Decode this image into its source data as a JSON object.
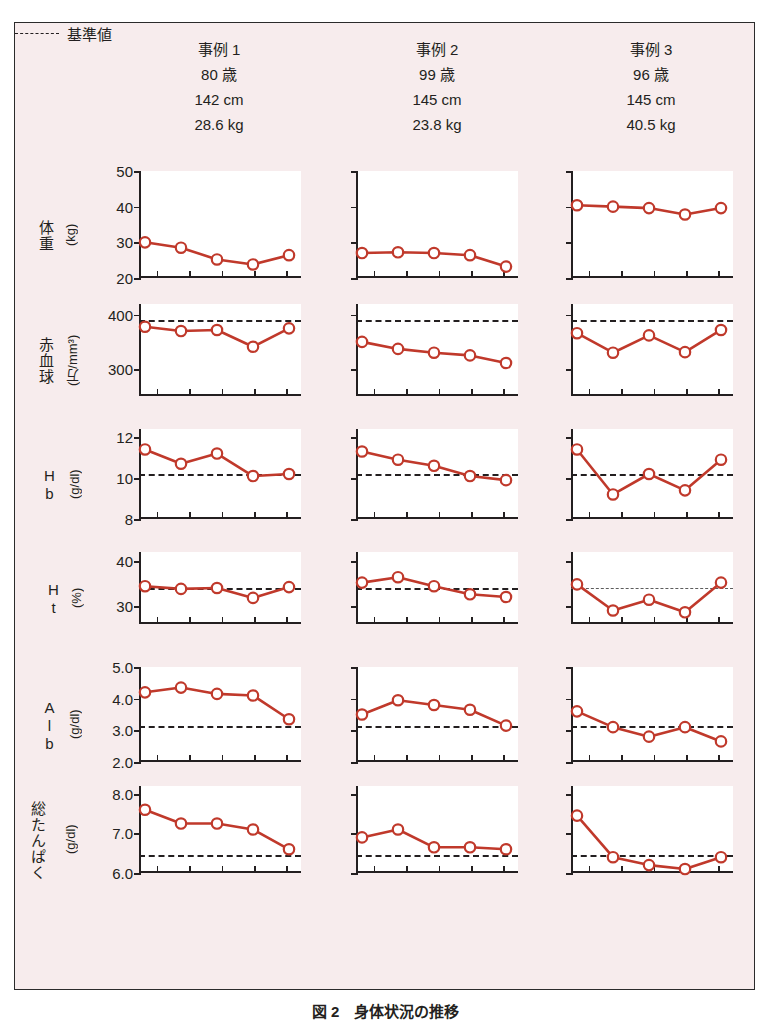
{
  "figure": {
    "caption": "図 2　身体状況の推移",
    "xtitle": "調査回",
    "legend_label": "基準値",
    "x_categories": [
      "第1回",
      "第2回",
      "第3回",
      "第4回",
      "第5回"
    ],
    "x_cat_parts": [
      {
        "top": "第",
        "mid": "1",
        "bot": "回"
      },
      {
        "top": "第",
        "mid": "2",
        "bot": "回"
      },
      {
        "top": "第",
        "mid": "3",
        "bot": "回"
      },
      {
        "top": "第",
        "mid": "4",
        "bot": "回"
      },
      {
        "top": "第",
        "mid": "5",
        "bot": "回"
      }
    ],
    "line_color": "#c0392b",
    "marker_fill": "#ffffff",
    "panel_bg": "#ffffff",
    "figure_bg": "#f7eced"
  },
  "cases": [
    {
      "title": "事例 1",
      "age": "80 歳",
      "height": "142 cm",
      "weight": "28.6 kg"
    },
    {
      "title": "事例 2",
      "age": "99 歳",
      "height": "145 cm",
      "weight": "23.8 kg"
    },
    {
      "title": "事例 3",
      "age": "96 歳",
      "height": "145 cm",
      "weight": "40.5 kg"
    }
  ],
  "rows": [
    {
      "label": "体重",
      "unit": "(kg)"
    },
    {
      "label": "赤血球",
      "unit": "(万/mm³)"
    },
    {
      "label": "Hb",
      "unit": "(g/dl)"
    },
    {
      "label": "Ht",
      "unit": "(%)"
    },
    {
      "label": "Alb",
      "unit": "(g/dl)"
    },
    {
      "label": "総たんぱく",
      "unit": "(g/dl)"
    }
  ],
  "chart_data": {
    "type": "line",
    "title": "図 2　身体状況の推移",
    "xlabel": "調査回",
    "categories": [
      "第1回",
      "第2回",
      "第3回",
      "第4回",
      "第5回"
    ],
    "grid": false,
    "legend": {
      "position": "bottom-right",
      "entries": [
        "基準値"
      ]
    },
    "panels": [
      {
        "row": "体重",
        "ylabel": "体重 (kg)",
        "ylim": [
          20,
          50
        ],
        "yticks": [
          20,
          30,
          40,
          50
        ],
        "reference": null,
        "series": [
          {
            "name": "事例 1",
            "values": [
              30.0,
              28.5,
              25.2,
              23.8,
              26.4
            ]
          },
          {
            "name": "事例 2",
            "values": [
              27.0,
              27.2,
              27.0,
              26.4,
              23.2
            ]
          },
          {
            "name": "事例 3",
            "values": [
              40.4,
              40.0,
              39.6,
              37.8,
              39.6
            ]
          }
        ]
      },
      {
        "row": "赤血球",
        "ylabel": "赤血球 (万/mm³)",
        "ylim": [
          250,
          420
        ],
        "yticks": [
          300,
          400
        ],
        "reference": 390,
        "series": [
          {
            "name": "事例 1",
            "values": [
              378,
              370,
              372,
              341,
              375
            ]
          },
          {
            "name": "事例 2",
            "values": [
              350,
              337,
              330,
              325,
              311
            ]
          },
          {
            "name": "事例 3",
            "values": [
              366,
              330,
              362,
              331,
              372
            ]
          }
        ]
      },
      {
        "row": "Hb",
        "ylabel": "Hb (g/dl)",
        "ylim": [
          8,
          12.4
        ],
        "yticks": [
          8,
          10,
          12
        ],
        "reference": 10.2,
        "series": [
          {
            "name": "事例 1",
            "values": [
              11.4,
              10.7,
              11.2,
              10.1,
              10.2
            ]
          },
          {
            "name": "事例 2",
            "values": [
              11.3,
              10.9,
              10.6,
              10.1,
              9.9
            ]
          },
          {
            "name": "事例 3",
            "values": [
              11.4,
              9.2,
              10.2,
              9.4,
              10.9
            ]
          }
        ]
      },
      {
        "row": "Ht",
        "ylabel": "Ht (%)",
        "ylim": [
          26,
          42
        ],
        "yticks": [
          30,
          40
        ],
        "reference": 34.0,
        "series": [
          {
            "name": "事例 1",
            "values": [
              34.4,
              33.8,
              34.0,
              31.8,
              34.2
            ]
          },
          {
            "name": "事例 2",
            "values": [
              35.2,
              36.4,
              34.4,
              32.6,
              32.0
            ]
          },
          {
            "name": "事例 3",
            "values": [
              34.8,
              29.0,
              31.4,
              28.6,
              35.2
            ]
          }
        ]
      },
      {
        "row": "Alb",
        "ylabel": "Alb (g/dl)",
        "ylim": [
          2.0,
          5.0
        ],
        "yticks": [
          2.0,
          3.0,
          4.0,
          5.0
        ],
        "reference": 3.15,
        "series": [
          {
            "name": "事例 1",
            "values": [
              4.2,
              4.35,
              4.15,
              4.1,
              3.35
            ]
          },
          {
            "name": "事例 2",
            "values": [
              3.5,
              3.95,
              3.8,
              3.65,
              3.15
            ]
          },
          {
            "name": "事例 3",
            "values": [
              3.6,
              3.1,
              2.8,
              3.1,
              2.65
            ]
          }
        ]
      },
      {
        "row": "総たんぱく",
        "ylabel": "総たんぱく (g/dl)",
        "ylim": [
          6.0,
          8.2
        ],
        "yticks": [
          6.0,
          7.0,
          8.0
        ],
        "reference": 6.45,
        "series": [
          {
            "name": "事例 1",
            "values": [
              7.6,
              7.25,
              7.25,
              7.1,
              6.6
            ]
          },
          {
            "name": "事例 2",
            "values": [
              6.9,
              7.1,
              6.65,
              6.65,
              6.6
            ]
          },
          {
            "name": "事例 3",
            "values": [
              7.45,
              6.4,
              6.2,
              6.1,
              6.4
            ]
          }
        ]
      }
    ]
  }
}
